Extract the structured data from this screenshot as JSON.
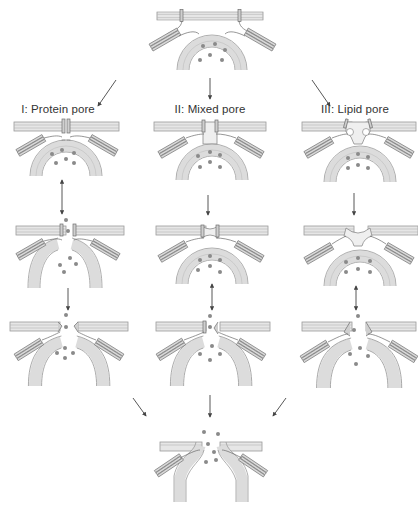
{
  "figure": {
    "type": "membrane fusion pore pathways diagram",
    "columns": [
      {
        "id": "I",
        "label": "I: Protein pore",
        "x": 55
      },
      {
        "id": "II",
        "label": "II: Mixed pore",
        "x": 205
      },
      {
        "id": "III",
        "label": "III: Lipid pore",
        "x": 355
      }
    ],
    "stages": [
      {
        "name": "docked-vesicle",
        "description": "Vesicle docked beneath plasma membrane with SNARE complexes and cargo"
      },
      {
        "name": "pore-initiation",
        "description": "Initial pore structure per model"
      },
      {
        "name": "pore-opening",
        "description": "Pore opens, cargo begins release"
      },
      {
        "name": "pore-expansion",
        "description": "Pore widens, cargo released"
      },
      {
        "name": "full-fusion",
        "description": "Common final state: expanded fusion pore with cargo release"
      }
    ],
    "arrows": {
      "top_to_columns": [
        "diagonal-left",
        "down",
        "diagonal-right"
      ],
      "column_I": [
        "double",
        "single-down"
      ],
      "column_II": [
        "single-down",
        "double"
      ],
      "column_III": [
        "single-down",
        "double"
      ],
      "columns_to_bottom": [
        "diagonal-right",
        "down",
        "diagonal-left"
      ]
    },
    "colors": {
      "membrane": "#e6e6e6",
      "outline": "#9a9a9a",
      "cargo": "#8a8a8a",
      "arrow": "#444444",
      "background": "#ffffff"
    }
  }
}
